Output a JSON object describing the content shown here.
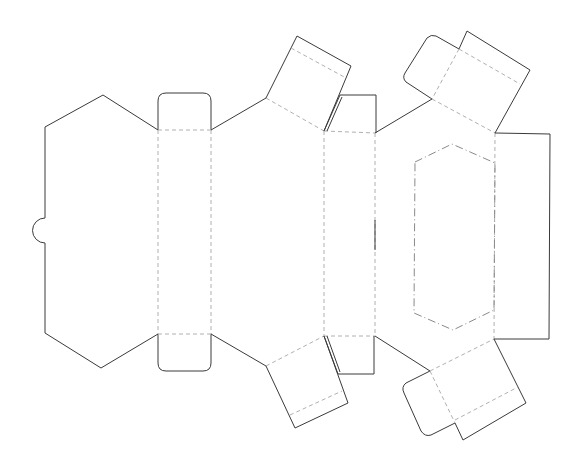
{
  "diagram": {
    "type": "box-dieline-net",
    "colors": {
      "background": "#ffffff",
      "cut_line": "#3a3a3a",
      "fold_line": "#b0b0b0",
      "window_line": "#8a8a8a"
    },
    "legend": {
      "cut": "solid line = cut",
      "fold": "dashed line = fold",
      "window": "dash-dot line = window cut-out"
    }
  }
}
